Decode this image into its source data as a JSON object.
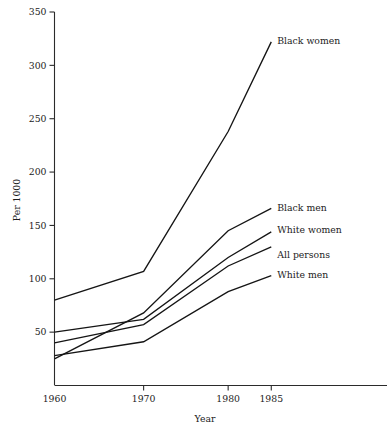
{
  "chart_data": {
    "type": "line",
    "title": "",
    "xlabel": "Year",
    "ylabel": "Per 1000",
    "x": [
      1960,
      1970,
      1980,
      1985
    ],
    "xtick_labels": [
      "1960",
      "1970",
      "1980",
      "1985"
    ],
    "ytick_labels": [
      "50",
      "100",
      "150",
      "200",
      "250",
      "300",
      "350"
    ],
    "yticks": [
      50,
      100,
      150,
      200,
      250,
      300,
      350
    ],
    "ylim": [
      0,
      350
    ],
    "xlim": [
      1960,
      1990
    ],
    "grid": false,
    "legend_position": "inline-right",
    "series": [
      {
        "name": "Black women",
        "values": [
          80,
          107,
          238,
          322
        ]
      },
      {
        "name": "Black men",
        "values": [
          25,
          68,
          145,
          166
        ]
      },
      {
        "name": "White women",
        "values": [
          50,
          62,
          120,
          144
        ]
      },
      {
        "name": "All persons",
        "values": [
          40,
          57,
          112,
          130
        ]
      },
      {
        "name": "White men",
        "values": [
          28,
          41,
          88,
          103
        ]
      }
    ]
  },
  "axes": {
    "y_title": "Per 1000",
    "x_title": "Year"
  }
}
